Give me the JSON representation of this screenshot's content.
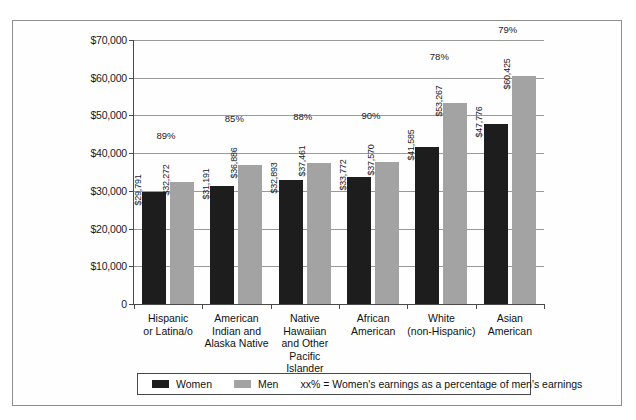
{
  "chart_data": {
    "type": "bar",
    "title": "",
    "xlabel": "",
    "ylabel": "",
    "ylim": [
      0,
      70000
    ],
    "grid": true,
    "legend_position": "bottom",
    "categories": [
      "Hispanic\nor Latina/o",
      "American\nIndian and\nAlaska Native",
      "Native\nHawaiian\nand Other\nPacific Islander",
      "African\nAmerican",
      "White\n(non-Hispanic)",
      "Asian\nAmerican"
    ],
    "ytick_labels": [
      "$70,000",
      "$60,000",
      "$50,000",
      "$40,000",
      "$30,000",
      "$20,000",
      "$10,000",
      "0"
    ],
    "ytick_values": [
      70000,
      60000,
      50000,
      40000,
      30000,
      20000,
      10000,
      0
    ],
    "series": [
      {
        "name": "Women",
        "color": "#1d1d1d",
        "values": [
          29791,
          31191,
          32893,
          33772,
          41585,
          47776
        ],
        "labels": [
          "$29,791",
          "$31,191",
          "$32,893",
          "$33,772",
          "$41,585",
          "$47,776"
        ]
      },
      {
        "name": "Men",
        "color": "#a3a3a3",
        "values": [
          32272,
          36886,
          37461,
          37570,
          53267,
          60425
        ],
        "labels": [
          "$32,272",
          "$36,886",
          "$37,461",
          "$37,570",
          "$53,267",
          "$60,425"
        ]
      }
    ],
    "annotations": {
      "ratio_labels": [
        "89%",
        "85%",
        "88%",
        "90%",
        "78%",
        "79%"
      ]
    }
  },
  "legend": {
    "women_label": "Women",
    "men_label": "Men",
    "note": "xx% = Women's earnings as a percentage of men's earnings"
  }
}
